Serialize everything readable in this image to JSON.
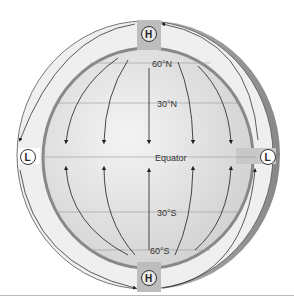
{
  "diagram": {
    "type": "global-atmospheric-circulation",
    "latitude_labels": [
      "60°N",
      "30°N",
      "Equator",
      "30°S",
      "60°S"
    ],
    "pressure_markers": {
      "north_pole": "H",
      "south_pole": "H",
      "equator_left": "L",
      "equator_right": "L"
    },
    "colors": {
      "globe": "#e6e6e6",
      "band": "#f0f0f0",
      "shade": "#9a9a9a",
      "lines": "#333333"
    }
  }
}
